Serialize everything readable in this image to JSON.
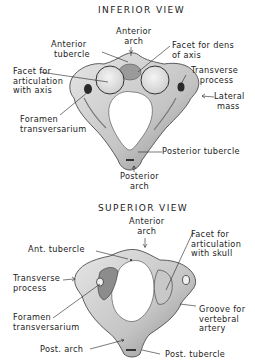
{
  "inferior_view": {
    "title": "INFERIOR VIEW",
    "labels": {
      "anterior_arch": "Anterior\narch",
      "anterior_tubercle": "Anterior\n tubercle",
      "facet_for_dens": "Facet for dens\nof axis",
      "facet_articulation_axis": "Facet for\narticulation\nwith axis",
      "transverse_process": "Transverse\n   process",
      "lateral_mass": "Lateral\n mass",
      "foramen_transversarium": "Foramen\ntransversarium",
      "posterior_tubercle": "Posterior tubercle",
      "posterior_arch": "Posterior\narch"
    }
  },
  "superior_view": {
    "title": "SUPERIOR VIEW",
    "labels": {
      "anterior_arch": "Anterior\narch",
      "ant_tubercle": "Ant. tubercle",
      "facet_articulation_skull": "Facet for\narticulation\nwith skull",
      "transverse_process": "Transverse\nprocess",
      "foramen_transversarium": "Foramen\ntransversarium",
      "groove_vertebral_artery": "Groove for\nvertebral\nartery",
      "post_arch": "Post. arch",
      "post_tubercle": "Post. tubercle"
    }
  },
  "colors": {
    "bone_fill": "#d8d8d8",
    "bone_shadow": "#6a6a6a",
    "facet_fill": "#ececec",
    "ink": "#1c1c1c"
  }
}
